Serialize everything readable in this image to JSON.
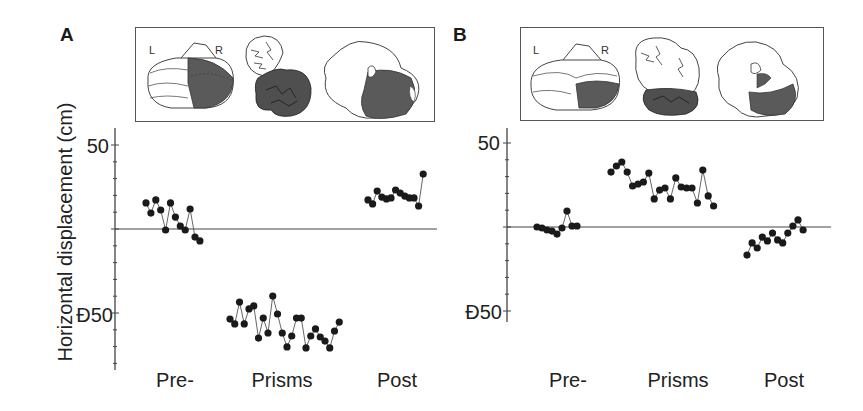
{
  "figure": {
    "ylabel": "Horizontal displacement (cm)",
    "panels": [
      {
        "letter": "A",
        "inset": {
          "left_label": "L",
          "right_label": "R"
        },
        "ticks": [
          "50",
          "Ð50"
        ],
        "categories": [
          "Pre-",
          "Prisms",
          "Post"
        ]
      },
      {
        "letter": "B",
        "inset": {
          "left_label": "L",
          "right_label": "R"
        },
        "ticks": [
          "50",
          "Ð50"
        ],
        "categories": [
          "Pre-",
          "Prisms",
          "Post"
        ]
      }
    ]
  },
  "colors": {
    "ink": "#1a1a1a",
    "axis": "#444444",
    "lesion_fill": "#5a5a5a"
  },
  "chart_data": [
    {
      "type": "scatter",
      "title": "A",
      "xlabel": "",
      "ylabel": "Horizontal displacement (cm)",
      "ylim": [
        -85,
        55
      ],
      "yticks": [
        50,
        0,
        -50
      ],
      "ytick_labels": [
        "50",
        "",
        "Ð50"
      ],
      "reference_line": 0,
      "grid": false,
      "categories": [
        "Pre-",
        "Prisms",
        "Post"
      ],
      "series": [
        {
          "name": "Pre-",
          "values": [
            15.5,
            9.5,
            17.3,
            11.3,
            -0.6,
            15.5,
            7.1,
            1.8,
            -0.6,
            11.9,
            -4.8,
            -7.1
          ]
        },
        {
          "name": "Prisms",
          "values": [
            -53.6,
            -56.5,
            -43.5,
            -56.5,
            -47.6,
            -45.8,
            -64.9,
            -53.0,
            -61.9,
            -39.9,
            -50.6,
            -61.9,
            -70.2,
            -63.7,
            -53.0,
            -53.0,
            -70.8,
            -63.7,
            -59.5,
            -64.3,
            -66.7,
            -70.8,
            -60.7,
            -55.4
          ]
        },
        {
          "name": "Post",
          "values": [
            17.3,
            14.9,
            22.6,
            19.0,
            17.9,
            18.5,
            23.2,
            21.4,
            19.6,
            18.5,
            18.5,
            13.7,
            32.7
          ]
        }
      ]
    },
    {
      "type": "scatter",
      "title": "B",
      "xlabel": "",
      "ylabel": "Horizontal displacement (cm)",
      "ylim": [
        -56,
        58
      ],
      "yticks": [
        50,
        0,
        -50
      ],
      "ytick_labels": [
        "50",
        "",
        "Ð50"
      ],
      "reference_line": 0,
      "grid": false,
      "categories": [
        "Pre-",
        "Prisms",
        "Post"
      ],
      "series": [
        {
          "name": "Pre-",
          "values": [
            0.0,
            -0.6,
            -1.8,
            -2.4,
            -4.2,
            -0.6,
            9.5,
            0.6,
            0.6
          ]
        },
        {
          "name": "Prisms",
          "values": [
            32.7,
            36.3,
            38.7,
            32.7,
            24.4,
            25.6,
            26.8,
            32.1,
            16.7,
            22.0,
            23.2,
            16.7,
            29.2,
            23.8,
            23.2,
            23.2,
            14.3,
            33.9,
            18.5,
            12.5
          ]
        },
        {
          "name": "Post",
          "values": [
            -16.7,
            -9.5,
            -12.5,
            -6.0,
            -8.3,
            -3.6,
            -7.7,
            -9.5,
            -3.6,
            0.6,
            4.2,
            -1.8
          ]
        }
      ]
    }
  ]
}
